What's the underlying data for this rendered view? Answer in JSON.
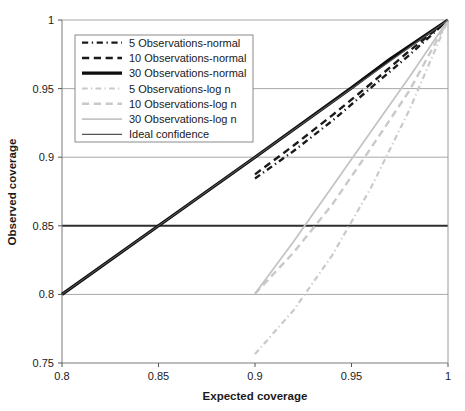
{
  "chart_data": {
    "type": "line",
    "title": "",
    "xlabel": "Expected coverage",
    "ylabel": "Observed coverage",
    "xlim": [
      0.8,
      1.0
    ],
    "ylim": [
      0.75,
      1.0
    ],
    "xticks": [
      "0.8",
      "0.85",
      "0.9",
      "0.95",
      "1"
    ],
    "xtick_values": [
      0.8,
      0.85,
      0.9,
      0.95,
      1.0
    ],
    "yticks": [
      "0.75",
      "0.8",
      "0.85",
      "0.9",
      "0.95",
      "1"
    ],
    "ytick_values": [
      0.75,
      0.8,
      0.85,
      0.9,
      0.95,
      1.0
    ],
    "grid": true,
    "grid_axis": "y",
    "legend_position": "upper-left",
    "series": [
      {
        "name": "5 Observations-normal",
        "style": "dashdot",
        "color": "#1a1a1a",
        "width": 2.4,
        "points": [
          [
            0.9,
            0.8845
          ],
          [
            0.92,
            0.9045
          ],
          [
            0.94,
            0.9265
          ],
          [
            0.96,
            0.9505
          ],
          [
            0.98,
            0.9745
          ],
          [
            1.0,
            1.0
          ]
        ]
      },
      {
        "name": "10 Observations-normal",
        "style": "dashed",
        "color": "#1a1a1a",
        "width": 2.4,
        "points": [
          [
            0.9,
            0.8875
          ],
          [
            0.92,
            0.9085
          ],
          [
            0.94,
            0.9305
          ],
          [
            0.96,
            0.9535
          ],
          [
            0.98,
            0.9775
          ],
          [
            1.0,
            1.0
          ]
        ]
      },
      {
        "name": "30 Observations-normal",
        "style": "solid",
        "color": "#0d0d0d",
        "width": 3.2,
        "points": [
          [
            0.8,
            0.8
          ],
          [
            0.85,
            0.85
          ],
          [
            0.9,
            0.9
          ],
          [
            0.95,
            0.9505
          ],
          [
            0.97,
            0.9715
          ],
          [
            1.0,
            1.0
          ]
        ]
      },
      {
        "name": "5 Observations-log n",
        "style": "dashdot",
        "color": "#c9c9c9",
        "width": 2.2,
        "points": [
          [
            0.9,
            0.7565
          ],
          [
            0.92,
            0.7885
          ],
          [
            0.94,
            0.8285
          ],
          [
            0.96,
            0.8775
          ],
          [
            0.98,
            0.9345
          ],
          [
            1.0,
            1.0
          ]
        ]
      },
      {
        "name": "10 Observations-log n",
        "style": "dashed",
        "color": "#c9c9c9",
        "width": 2.4,
        "points": [
          [
            0.9,
            0.8005
          ],
          [
            0.92,
            0.8305
          ],
          [
            0.94,
            0.8655
          ],
          [
            0.96,
            0.9065
          ],
          [
            0.98,
            0.9485
          ],
          [
            1.0,
            1.0
          ]
        ]
      },
      {
        "name": "30 Observations-log n",
        "style": "solid",
        "color": "#c4c4c4",
        "width": 1.8,
        "points": [
          [
            0.9,
            0.8005
          ],
          [
            0.92,
            0.8385
          ],
          [
            0.94,
            0.8785
          ],
          [
            0.96,
            0.9185
          ],
          [
            0.98,
            0.9585
          ],
          [
            1.0,
            1.0
          ]
        ]
      },
      {
        "name": "Ideal confidence",
        "style": "solid",
        "color": "#555555",
        "width": 1.1,
        "points": [
          [
            0.8,
            0.8
          ],
          [
            1.0,
            1.0
          ]
        ]
      }
    ]
  },
  "legend": {
    "items": [
      {
        "label": "5 Observations-normal"
      },
      {
        "label": "10 Observations-normal"
      },
      {
        "label": "30 Observations-normal"
      },
      {
        "label": "5 Observations-log n"
      },
      {
        "label": "10 Observations-log n"
      },
      {
        "label": "30 Observations-log n"
      },
      {
        "label": "Ideal confidence"
      }
    ]
  }
}
